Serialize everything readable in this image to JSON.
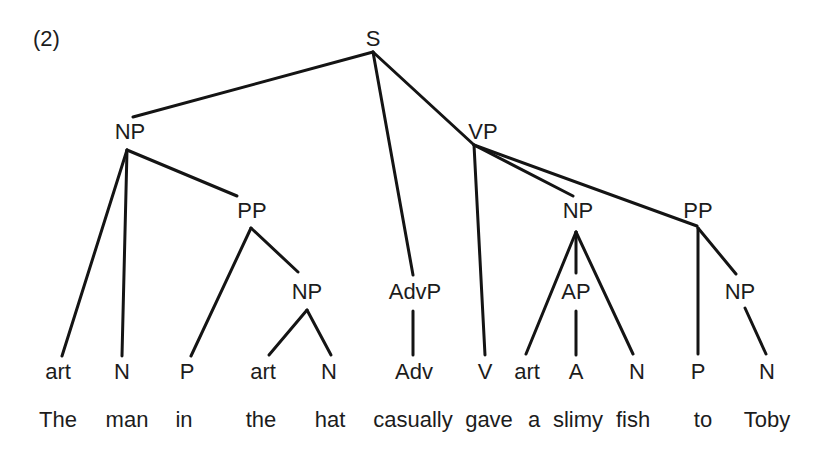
{
  "example_number": "(2)",
  "tree": {
    "nodes": [
      {
        "id": "S",
        "label": "S",
        "x": 373,
        "y": 40,
        "anchor_top": [
          373,
          52
        ],
        "anchor_bottom": [
          373,
          52
        ]
      },
      {
        "id": "NP1",
        "label": "NP",
        "x": 130,
        "y": 133,
        "anchor_top": [
          133,
          117
        ],
        "anchor_bottom": [
          127,
          150
        ]
      },
      {
        "id": "PP1",
        "label": "PP",
        "x": 252,
        "y": 212,
        "anchor_top": [
          237,
          196
        ],
        "anchor_bottom": [
          251,
          228
        ]
      },
      {
        "id": "NP2",
        "label": "NP",
        "x": 307,
        "y": 293,
        "anchor_top": [
          298,
          272
        ],
        "anchor_bottom": [
          307,
          310
        ]
      },
      {
        "id": "AdvP",
        "label": "AdvP",
        "x": 415,
        "y": 293,
        "anchor_top": [
          413,
          275
        ],
        "anchor_bottom": [
          413,
          311
        ]
      },
      {
        "id": "VP",
        "label": "VP",
        "x": 483,
        "y": 133,
        "anchor_top": [
          473,
          144
        ],
        "anchor_bottom": [
          474,
          145
        ]
      },
      {
        "id": "NP3",
        "label": "NP",
        "x": 578,
        "y": 212,
        "anchor_top": [
          573,
          196
        ],
        "anchor_bottom": [
          576,
          232
        ]
      },
      {
        "id": "AP",
        "label": "AP",
        "x": 576,
        "y": 293,
        "anchor_top": [
          576,
          273
        ],
        "anchor_bottom": [
          576,
          311
        ]
      },
      {
        "id": "PP2",
        "label": "PP",
        "x": 698,
        "y": 212,
        "anchor_top": [
          697,
          226
        ],
        "anchor_bottom": [
          698,
          228
        ]
      },
      {
        "id": "NP4",
        "label": "NP",
        "x": 740,
        "y": 293,
        "anchor_top": [
          736,
          274
        ],
        "anchor_bottom": [
          745,
          308
        ]
      },
      {
        "id": "art1",
        "label": "art",
        "x": 58,
        "y": 373,
        "anchor_top": [
          62,
          356
        ]
      },
      {
        "id": "N1",
        "label": "N",
        "x": 122,
        "y": 373,
        "anchor_top": [
          122,
          356
        ]
      },
      {
        "id": "P1",
        "label": "P",
        "x": 187,
        "y": 373,
        "anchor_top": [
          191,
          356
        ]
      },
      {
        "id": "art2",
        "label": "art",
        "x": 263,
        "y": 373,
        "anchor_top": [
          269,
          355
        ]
      },
      {
        "id": "N2",
        "label": "N",
        "x": 329,
        "y": 373,
        "anchor_top": [
          331,
          355
        ]
      },
      {
        "id": "Adv",
        "label": "Adv",
        "x": 414,
        "y": 373,
        "anchor_top": [
          413,
          355
        ]
      },
      {
        "id": "V",
        "label": "V",
        "x": 485,
        "y": 373,
        "anchor_top": [
          485,
          355
        ]
      },
      {
        "id": "art3",
        "label": "art",
        "x": 527,
        "y": 373,
        "anchor_top": [
          526,
          354
        ]
      },
      {
        "id": "A",
        "label": "A",
        "x": 576,
        "y": 373,
        "anchor_top": [
          576,
          355
        ]
      },
      {
        "id": "N3",
        "label": "N",
        "x": 637,
        "y": 373,
        "anchor_top": [
          633,
          354
        ]
      },
      {
        "id": "P2",
        "label": "P",
        "x": 698,
        "y": 373,
        "anchor_top": [
          698,
          354
        ]
      },
      {
        "id": "N4",
        "label": "N",
        "x": 767,
        "y": 373,
        "anchor_top": [
          766,
          354
        ]
      }
    ],
    "edges": [
      [
        "S",
        "NP1"
      ],
      [
        "S",
        "AdvP"
      ],
      [
        "S",
        "VP"
      ],
      [
        "NP1",
        "art1"
      ],
      [
        "NP1",
        "N1"
      ],
      [
        "NP1",
        "PP1"
      ],
      [
        "PP1",
        "P1"
      ],
      [
        "PP1",
        "NP2"
      ],
      [
        "NP2",
        "art2"
      ],
      [
        "NP2",
        "N2"
      ],
      [
        "AdvP",
        "Adv"
      ],
      [
        "VP",
        "V"
      ],
      [
        "VP",
        "NP3"
      ],
      [
        "VP",
        "PP2"
      ],
      [
        "NP3",
        "art3"
      ],
      [
        "NP3",
        "AP"
      ],
      [
        "NP3",
        "N3"
      ],
      [
        "AP",
        "A"
      ],
      [
        "PP2",
        "P2"
      ],
      [
        "PP2",
        "NP4"
      ],
      [
        "NP4",
        "N4"
      ]
    ]
  },
  "sentence": {
    "words": [
      {
        "text": "The",
        "x": 58
      },
      {
        "text": "man",
        "x": 127
      },
      {
        "text": "in",
        "x": 184
      },
      {
        "text": "the",
        "x": 261
      },
      {
        "text": "hat",
        "x": 330
      },
      {
        "text": "casually",
        "x": 413
      },
      {
        "text": "gave",
        "x": 489
      },
      {
        "text": "a",
        "x": 534
      },
      {
        "text": "slimy",
        "x": 578
      },
      {
        "text": "fish",
        "x": 633
      },
      {
        "text": "to",
        "x": 703
      },
      {
        "text": "Toby",
        "x": 767
      }
    ],
    "y": 421
  },
  "colors": {
    "ink": "#1c1c1c",
    "line": "#141414",
    "background": "#ffffff"
  }
}
